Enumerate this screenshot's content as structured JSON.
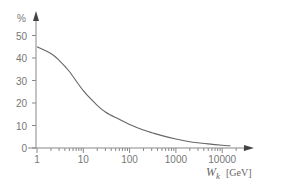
{
  "chart_data": {
    "type": "line",
    "title": "",
    "xlabel": "W_k [GeV]",
    "xlabel_main": "W",
    "xlabel_sub": "k",
    "xlabel_unit": "[GeV]",
    "ylabel": "%",
    "xscale": "log",
    "xlim": [
      1,
      30000
    ],
    "ylim": [
      0,
      55
    ],
    "grid": false,
    "legend": null,
    "x_ticks": [
      1,
      10,
      100,
      1000,
      10000
    ],
    "x_tick_labels": [
      "1",
      "10",
      "100",
      "1000",
      "10000"
    ],
    "y_ticks": [
      0,
      10,
      20,
      30,
      40,
      50
    ],
    "y_tick_labels": [
      "0",
      "10",
      "20",
      "30",
      "40",
      "50"
    ],
    "series": [
      {
        "name": "curve",
        "x": [
          1,
          2,
          3,
          5,
          10,
          20,
          30,
          50,
          100,
          200,
          300,
          500,
          1000,
          2000,
          3000,
          5000,
          10000,
          15000
        ],
        "values": [
          45,
          42,
          39,
          34,
          25.5,
          19,
          16,
          13.5,
          10.5,
          8,
          6.8,
          5.5,
          4,
          2.8,
          2.3,
          1.8,
          1.2,
          1
        ]
      }
    ]
  },
  "colors": {
    "axis": "#888888",
    "curve": "#666666",
    "text": "#777777"
  }
}
